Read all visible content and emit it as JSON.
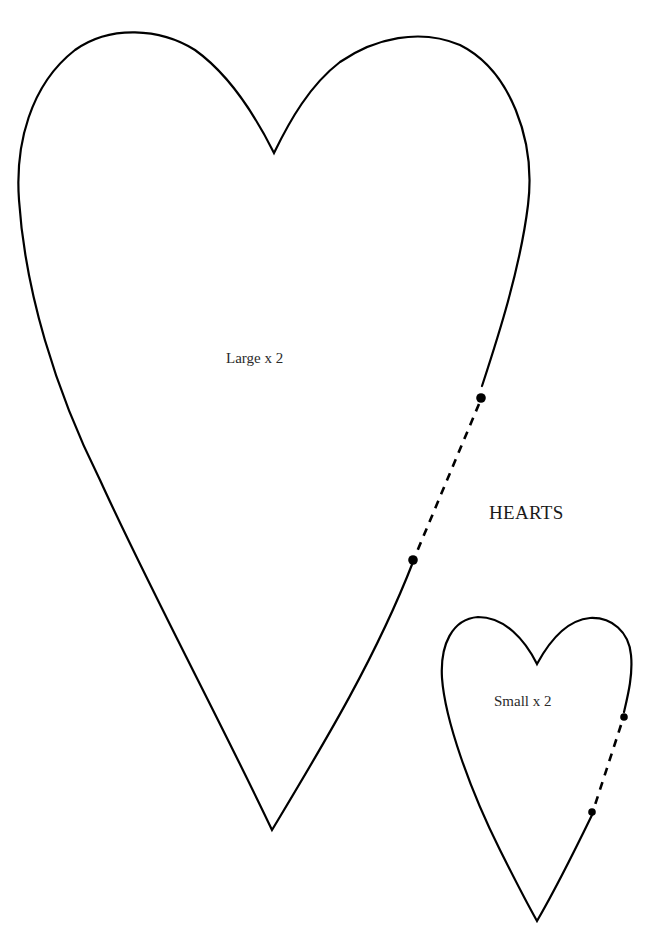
{
  "page": {
    "title": "HEARTS",
    "background": "#ffffff",
    "line_color": "#000000"
  },
  "pieces": [
    {
      "name": "large-heart",
      "label": "Large x 2",
      "has_fold_line": true
    },
    {
      "name": "small-heart",
      "label": "Small x 2",
      "has_fold_line": true
    }
  ]
}
